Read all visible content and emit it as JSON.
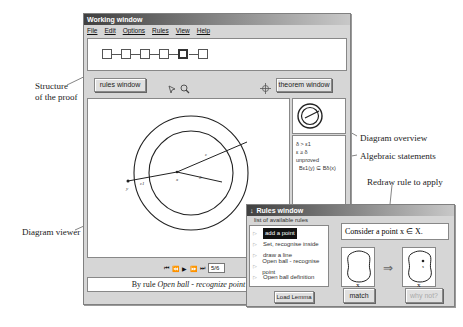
{
  "annotations": {
    "structure": [
      "Structure",
      "of the proof"
    ],
    "diagram_overview": "Diagram overview",
    "algebraic_statements": "Algebraic statements",
    "redraw_rule": "Redraw rule to apply",
    "diagram_viewer": "Diagram viewer"
  },
  "working_window": {
    "title": "Working window",
    "menu": [
      "File",
      "Edit",
      "Options",
      "Rules",
      "View",
      "Help"
    ],
    "proof_nodes": 6,
    "active_node": 4,
    "toolbar": {
      "rules_button": "rules window",
      "theorem_button": "theorem window"
    },
    "diagram_labels": {
      "y": "y",
      "e1": "ε1",
      "x": "x",
      "e": "ε",
      "d": "δ"
    },
    "playback": {
      "controls": [
        "first",
        "prev",
        "play",
        "next",
        "last"
      ],
      "step": "5/6"
    },
    "caption": {
      "prefix": "By rule ",
      "rule": "Open ball - recognize point"
    },
    "statements": [
      "δ > ε1",
      "ε ≥ δ",
      "unproved",
      "Bε1(y) ⊆ Bδ(x)"
    ]
  },
  "rules_window": {
    "title": "Rules window",
    "list_header": "list of available rules",
    "rules": [
      {
        "label": "add a point",
        "selected": true
      },
      {
        "label": "Set, recognise inside",
        "selected": false
      },
      {
        "label": "draw a line",
        "selected": false
      },
      {
        "label": "Open ball - recognise point",
        "selected": false
      },
      {
        "label": "Open ball definition",
        "selected": false
      }
    ],
    "load_button": "Load Lemma",
    "rule_text": "Consider a point x ∈ X.",
    "set_label": "X",
    "point_label": "x",
    "match_button": "match",
    "why_not_button": "why not?"
  }
}
